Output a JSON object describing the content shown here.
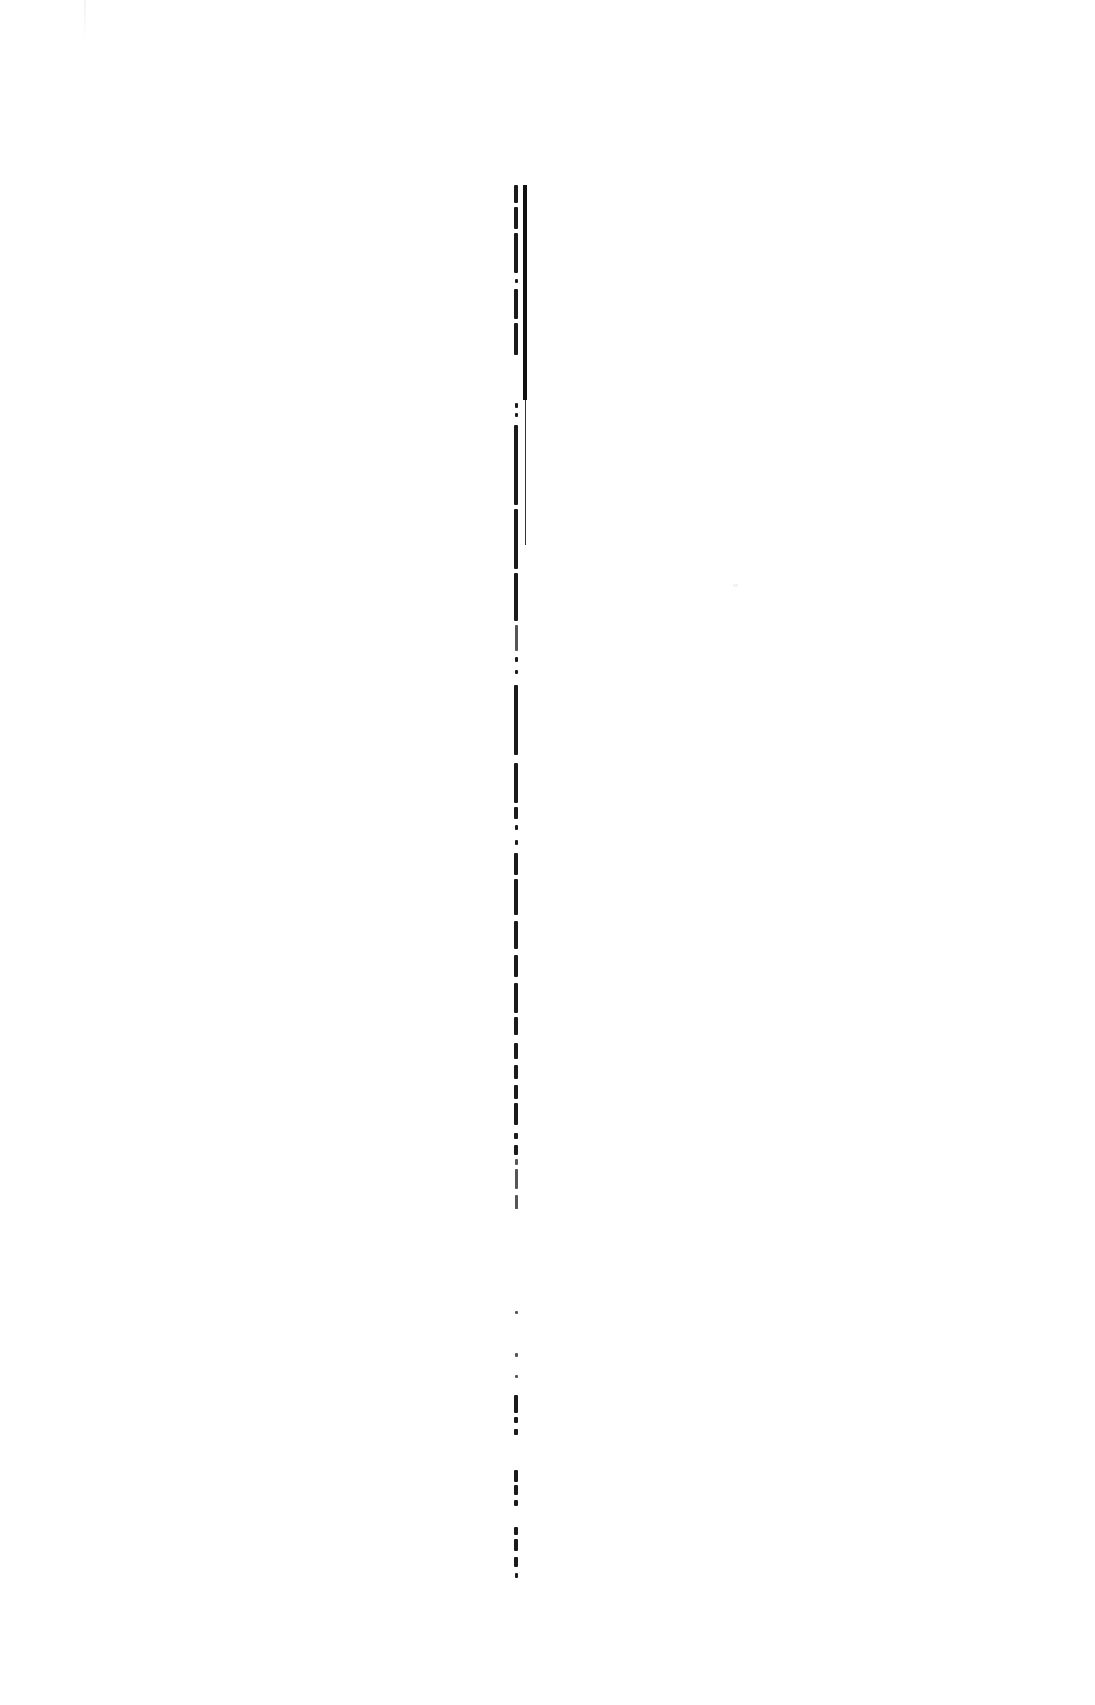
{
  "document": {
    "type": "scanned-page",
    "orientation_note": "single line of rotated (vertical) text near page center",
    "text_strip": {
      "content": "[illegible scanned text]",
      "legible": false
    },
    "vertical_rule": {
      "present": true,
      "color": "#111111"
    },
    "background_color": "#ffffff",
    "ink_color": "#1a1a1a"
  }
}
